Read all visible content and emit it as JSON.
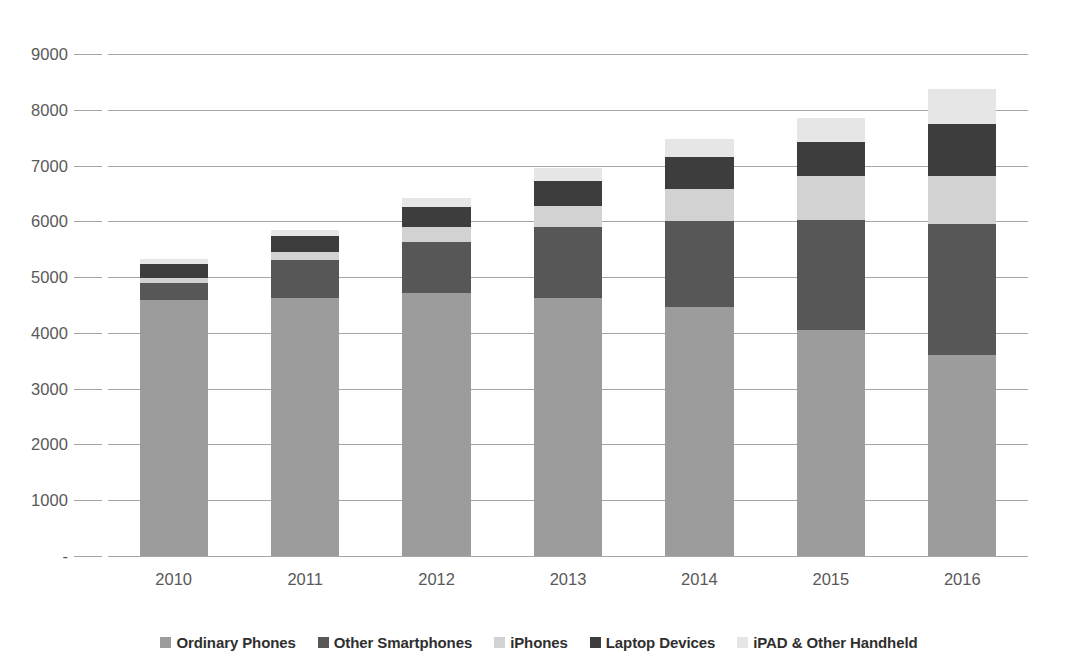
{
  "chart_data": {
    "type": "bar",
    "subtype": "stacked-bar",
    "title": "",
    "xlabel": "",
    "ylabel": "",
    "categories": [
      "2010",
      "2011",
      "2012",
      "2013",
      "2014",
      "2015",
      "2016"
    ],
    "ylim": [
      0,
      9000
    ],
    "y_ticks": [
      "-",
      "1000",
      "2000",
      "3000",
      "4000",
      "5000",
      "6000",
      "7000",
      "8000",
      "9000"
    ],
    "y_tick_values": [
      0,
      1000,
      2000,
      3000,
      4000,
      5000,
      6000,
      7000,
      8000,
      9000
    ],
    "grid": true,
    "legend_position": "bottom",
    "series": [
      {
        "name": "Ordinary Phones",
        "color": "#9c9c9c",
        "values": [
          4590,
          4625,
          4715,
          4625,
          4460,
          4050,
          3600
        ]
      },
      {
        "name": "Other Smartphones",
        "color": "#575757",
        "values": [
          300,
          675,
          915,
          1275,
          1540,
          1970,
          2350
        ]
      },
      {
        "name": "iPhones",
        "color": "#d2d2d2",
        "values": [
          90,
          150,
          270,
          370,
          575,
          790,
          860
        ]
      },
      {
        "name": "Laptop Devices",
        "color": "#3d3d3d",
        "values": [
          250,
          285,
          360,
          450,
          575,
          610,
          930
        ]
      },
      {
        "name": "iPAD & Other Handheld",
        "color": "#e6e6e6",
        "values": [
          100,
          105,
          160,
          230,
          325,
          430,
          640
        ]
      }
    ],
    "totals": [
      5330,
      5840,
      6420,
      6950,
      7475,
      7850,
      8380
    ]
  },
  "axis": {
    "y_labels": [
      "9000",
      "8000",
      "7000",
      "6000",
      "5000",
      "4000",
      "3000",
      "2000",
      "1000",
      "-"
    ],
    "x_labels": [
      "2010",
      "2011",
      "2012",
      "2013",
      "2014",
      "2015",
      "2016"
    ]
  },
  "legend": {
    "items": [
      {
        "label": "Ordinary Phones",
        "color": "#9c9c9c"
      },
      {
        "label": "Other Smartphones",
        "color": "#575757"
      },
      {
        "label": "iPhones",
        "color": "#d2d2d2"
      },
      {
        "label": "Laptop Devices",
        "color": "#3d3d3d"
      },
      {
        "label": "iPAD & Other Handheld",
        "color": "#e6e6e6"
      }
    ]
  },
  "colors": {
    "gridline": "#a6a6a6",
    "axis_text": "#595959",
    "legend_text": "#2f2f2f",
    "background": "#ffffff"
  }
}
